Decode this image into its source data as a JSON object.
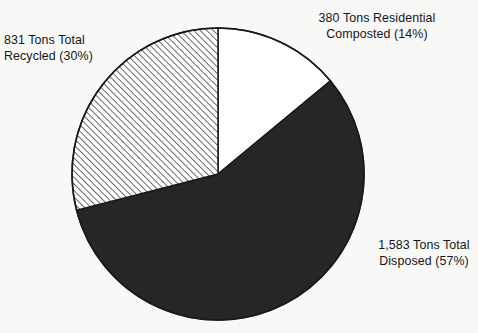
{
  "chart_data": {
    "type": "pie",
    "title": "",
    "subtitle": "",
    "xlabel": "",
    "ylabel": "",
    "grid": false,
    "legend_position": "none",
    "label_style": "outside-callout",
    "total_tons": 2794,
    "units": "Tons",
    "start_angle_deg": 0,
    "direction": "clockwise",
    "center": {
      "x": 218,
      "y": 174
    },
    "radius": 146,
    "categories": [
      "380 Tons Residential Composted (14%)",
      "1,583 Tons Total Disposed (57%)",
      "831 Tons Total Recycled (30%)"
    ],
    "values": [
      380,
      1583,
      831
    ],
    "percentages": [
      14,
      57,
      30
    ],
    "slices": [
      {
        "key": "composted",
        "name": "Residential Composted",
        "tons": 380,
        "tons_text": "380",
        "percent": 14,
        "percent_text": "(14%)",
        "fill": "#ffffff",
        "fill_style": "solid-white",
        "stroke": "#1a1a1a",
        "start_deg": 0,
        "end_deg": 50.4,
        "label_line1": "380 Tons Residential",
        "label_line2": "Composted (14%)"
      },
      {
        "key": "disposed",
        "name": "Total Disposed",
        "tons": 1583,
        "tons_text": "1,583",
        "percent": 57,
        "percent_text": "(57%)",
        "fill": "#262626",
        "fill_style": "solid-black",
        "stroke": "#1a1a1a",
        "start_deg": 50.4,
        "end_deg": 255.6,
        "label_line1": "1,583 Tons Total",
        "label_line2": "Disposed (57%)"
      },
      {
        "key": "recycled",
        "name": "Total Recycled",
        "tons": 831,
        "tons_text": "831",
        "percent": 30,
        "percent_text": "(30%)",
        "fill": "#ffffff",
        "fill_style": "diagonal-hatch",
        "stroke": "#1a1a1a",
        "start_deg": 255.6,
        "end_deg": 360,
        "label_line1": "831 Tons Total",
        "label_line2": "Recycled (30%)"
      }
    ]
  },
  "labels": {
    "composted": {
      "line1": "380 Tons Residential",
      "line2": "Composted (14%)"
    },
    "disposed": {
      "line1": "1,583 Tons Total",
      "line2": "Disposed (57%)"
    },
    "recycled": {
      "line1": "831 Tons Total",
      "line2": "Recycled (30%)"
    }
  },
  "colors": {
    "background": "#f8f8f7",
    "ink": "#1a1a1a",
    "slice_dark": "#262626",
    "slice_light": "#ffffff",
    "hatch_line": "#3a3a3a",
    "text": "#171717"
  }
}
